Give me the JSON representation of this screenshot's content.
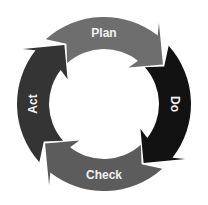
{
  "diagram": {
    "type": "cycle",
    "center": [
      104,
      104
    ],
    "outer_radius": 87,
    "inner_radius": 55,
    "segments": [
      {
        "label": "Plan",
        "color": "#6e6e6e",
        "start_deg": -42,
        "end_deg": 48,
        "label_deg": 0,
        "label_rotate": 0
      },
      {
        "label": "Do",
        "color": "#121212",
        "start_deg": 48,
        "end_deg": 138,
        "label_deg": 90,
        "label_rotate": 90
      },
      {
        "label": "Check",
        "color": "#5c5c5c",
        "start_deg": 138,
        "end_deg": 228,
        "label_deg": 180,
        "label_rotate": 0
      },
      {
        "label": "Act",
        "color": "#343434",
        "start_deg": 228,
        "end_deg": 318,
        "label_deg": 270,
        "label_rotate": -90
      }
    ]
  }
}
